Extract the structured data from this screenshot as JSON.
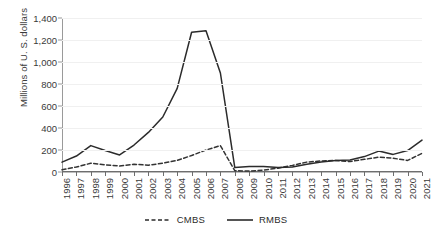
{
  "chart_data": {
    "type": "line",
    "title": "",
    "xlabel": "",
    "ylabel": "Millions of U. S. dollars",
    "ylim": [
      0,
      1400
    ],
    "yticks": [
      0,
      200,
      400,
      600,
      800,
      1000,
      1200,
      1400
    ],
    "ytick_labels": [
      "0",
      "200",
      "400",
      "600",
      "800",
      "1,000",
      "1,200",
      "1,400"
    ],
    "grid": true,
    "legend_position": "bottom-center",
    "categories": [
      "1996",
      "1997",
      "1998",
      "1999",
      "2000",
      "2001",
      "2002",
      "2003",
      "2004",
      "2005",
      "2006",
      "2007",
      "2008",
      "2009",
      "2010",
      "2011",
      "2012",
      "2013",
      "2014",
      "2015",
      "2016",
      "2017",
      "2018",
      "2019",
      "2020",
      "2021"
    ],
    "series": [
      {
        "name": "CMBS",
        "style": "dashed",
        "color": "#333333",
        "values": [
          20,
          45,
          80,
          65,
          55,
          70,
          62,
          80,
          105,
          150,
          200,
          240,
          12,
          8,
          18,
          35,
          60,
          90,
          100,
          105,
          95,
          115,
          135,
          125,
          105,
          170
        ]
      },
      {
        "name": "RMBS",
        "style": "solid",
        "color": "#2b2b2b",
        "values": [
          90,
          145,
          240,
          195,
          155,
          245,
          360,
          500,
          760,
          1270,
          1285,
          900,
          40,
          50,
          50,
          40,
          45,
          70,
          90,
          105,
          110,
          140,
          190,
          160,
          195,
          290
        ]
      }
    ]
  },
  "legend": {
    "items": [
      {
        "label": "CMBS",
        "style": "dashed"
      },
      {
        "label": "RMBS",
        "style": "solid"
      }
    ]
  }
}
